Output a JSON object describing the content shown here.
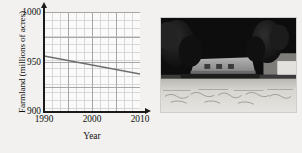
{
  "figure": {
    "background_color": "#f2f1ef"
  },
  "chart_data": {
    "type": "line",
    "title": "",
    "xlabel": "Year",
    "ylabel": "Farmland (millions of acres)",
    "x": [
      1990,
      2010
    ],
    "values": [
      956,
      938
    ],
    "series": [
      {
        "name": "Farmland",
        "values": [
          956,
          938
        ],
        "color": "#6e6e6e"
      }
    ],
    "xlim": [
      1990,
      2010
    ],
    "ylim": [
      900,
      1000
    ],
    "xticks": [
      1990,
      2000,
      2010
    ],
    "xtick_labels": [
      "1990",
      "2000",
      "2010"
    ],
    "yticks": [
      900,
      950,
      1000
    ],
    "ytick_labels": [
      "900",
      "950",
      "1000"
    ],
    "grid": true,
    "grid_minor": true,
    "legend": false,
    "axis_arrows": true,
    "line_color": "#6e6e6e",
    "grid_color_minor": "#d9d7d6",
    "grid_color_major": "#a9a7a6",
    "axis_color": "#1a1a1a",
    "plot_background": "#fbfafa"
  },
  "photo": {
    "caption": "",
    "description": "farm-landscape-photograph",
    "colors": {
      "sky": "#0d0d0d",
      "trees": "#141414",
      "barn": "#9a9a9a",
      "field": "#d6d4d0",
      "border": "#cfcdcb"
    }
  }
}
